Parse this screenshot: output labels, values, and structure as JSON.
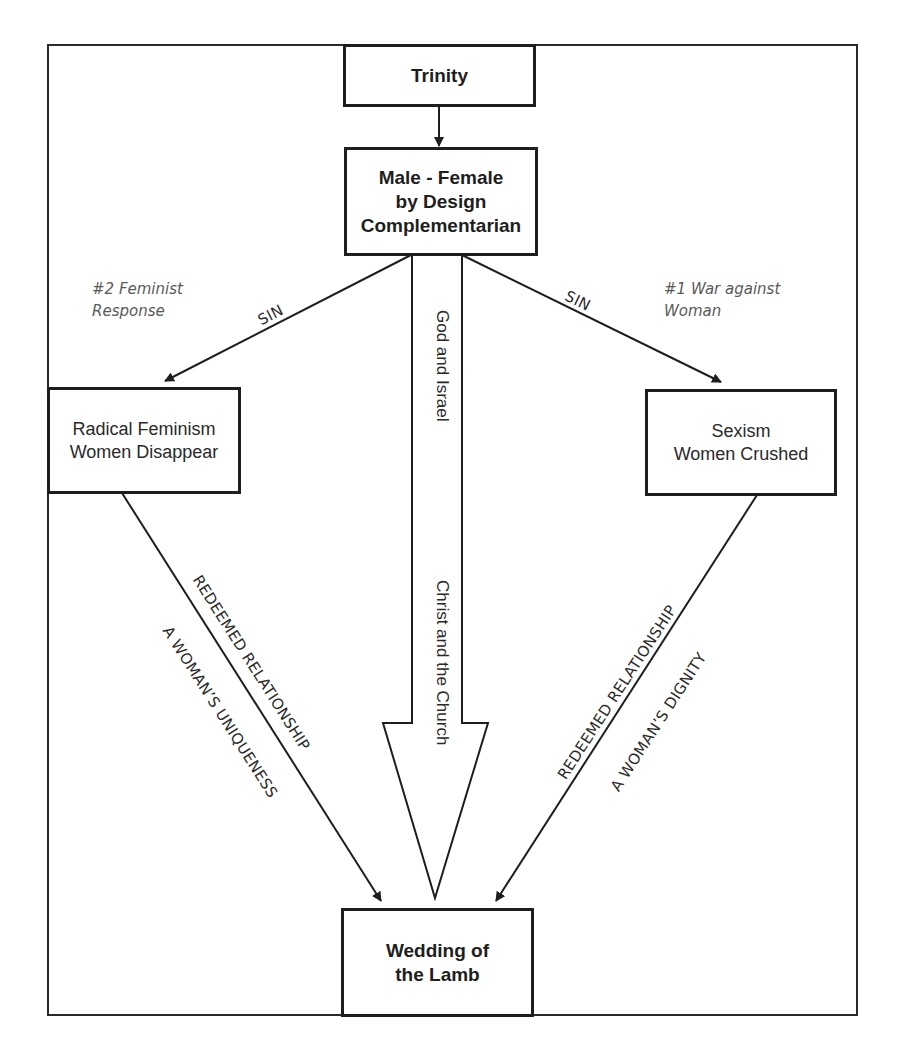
{
  "diagram": {
    "nodes": {
      "trinity": {
        "label": "Trinity"
      },
      "male_female": {
        "label": "Male - Female\nby Design\nComplementarian"
      },
      "radical_feminism": {
        "label": "Radical Feminism\nWomen Disappear"
      },
      "sexism": {
        "label": "Sexism\nWomen Crushed"
      },
      "wedding": {
        "label": "Wedding of\nthe Lamb"
      }
    },
    "notes": {
      "left": "#2 Feminist\nResponse",
      "right": "#1 War against\nWoman"
    },
    "edges": {
      "sin_left": "SIN",
      "sin_right": "SIN",
      "center_top": "God and Israel",
      "center_bottom": "Christ and the Church",
      "left_upper": "REDEEMED RELATIONSHIP",
      "left_lower": "A WOMAN’S UNIQUENESS",
      "right_upper": "REDEEMED RELATIONSHIP",
      "right_lower": "A WOMAN’S DIGNITY"
    },
    "colors": {
      "stroke": "#1e1e1e",
      "note_text": "#5a5a5a",
      "background": "#ffffff"
    }
  }
}
